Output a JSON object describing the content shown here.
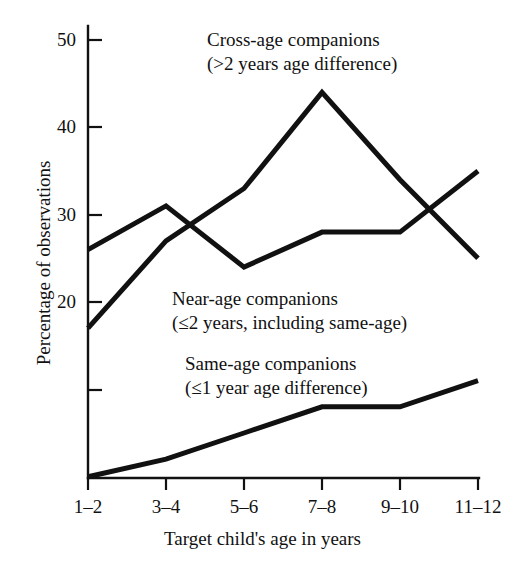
{
  "chart_data": {
    "type": "line",
    "title": "",
    "xlabel": "Target child's age in years",
    "ylabel": "Percentage of observations",
    "categories": [
      "1–2",
      "3–4",
      "5–6",
      "7–8",
      "9–10",
      "11–12"
    ],
    "ylim": [
      0,
      52
    ],
    "yticks": [
      20,
      30,
      40,
      50
    ],
    "ytick_labels": [
      "20",
      "30",
      "40",
      "50"
    ],
    "unlabeled_yticks": [
      10
    ],
    "grid": false,
    "legend_position": "inline-annotations",
    "series": [
      {
        "name": "Cross-age companions",
        "sublabel": "(>2 years age difference)",
        "values": [
          17,
          27,
          33,
          44,
          34,
          25
        ]
      },
      {
        "name": "Near-age companions",
        "sublabel": "(≤2 years, including same-age)",
        "values": [
          26,
          31,
          24,
          28,
          28,
          35
        ]
      },
      {
        "name": "Same-age companions",
        "sublabel": "(≤1 year age difference)",
        "values": [
          0,
          2,
          5,
          8,
          8,
          11
        ]
      }
    ]
  },
  "axes": {
    "y_axis_label": "Percentage of observations",
    "x_axis_label": "Target child's age in years",
    "y_tick_labels": [
      "50",
      "40",
      "30",
      "20"
    ],
    "x_tick_labels": [
      "1–2",
      "3–4",
      "5–6",
      "7–8",
      "9–10",
      "11–12"
    ]
  },
  "annotations": {
    "cross_age": {
      "line1": "Cross-age companions",
      "line2": "(>2 years age difference)"
    },
    "near_age": {
      "line1": "Near-age companions",
      "line2": "(≤2 years, including same-age)"
    },
    "same_age": {
      "line1": "Same-age companions",
      "line2": "(≤1 year age difference)"
    }
  },
  "colors": {
    "line": "#111111",
    "axis": "#111111",
    "background": "#ffffff"
  }
}
